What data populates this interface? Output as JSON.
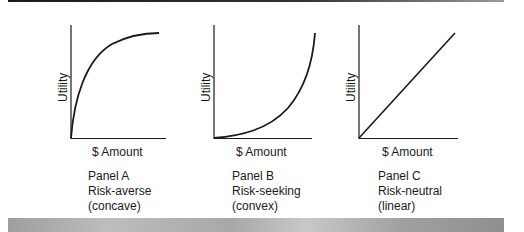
{
  "figure": {
    "panels": [
      {
        "id": "A",
        "ylabel": "Utility",
        "xlabel": "$ Amount",
        "caption": [
          "Panel A",
          "Risk-averse",
          "(concave)"
        ],
        "curve_shape": "concave"
      },
      {
        "id": "B",
        "ylabel": "Utility",
        "xlabel": "$ Amount",
        "caption": [
          "Panel B",
          "Risk-seeking",
          "(convex)"
        ],
        "curve_shape": "convex"
      },
      {
        "id": "C",
        "ylabel": "Utility",
        "xlabel": "$ Amount",
        "caption": [
          "Panel C",
          "Risk-neutral",
          "(linear)"
        ],
        "curve_shape": "linear"
      }
    ],
    "colors": {
      "line": "#1a1a1a",
      "top_rule": "#1a1a1a",
      "bottom_band": "#a8a8a8"
    }
  }
}
